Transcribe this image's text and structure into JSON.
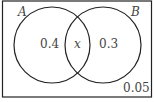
{
  "diagram": {
    "type": "venn",
    "sets": [
      {
        "name": "A",
        "label": "A",
        "only_value": "0.4"
      },
      {
        "name": "B",
        "label": "B",
        "only_value": "0.3"
      }
    ],
    "intersection": {
      "label": "x"
    },
    "outside": {
      "value": "0.05"
    },
    "colors": {
      "stroke": "#222222",
      "text": "#444444",
      "background": "#ffffff"
    }
  }
}
